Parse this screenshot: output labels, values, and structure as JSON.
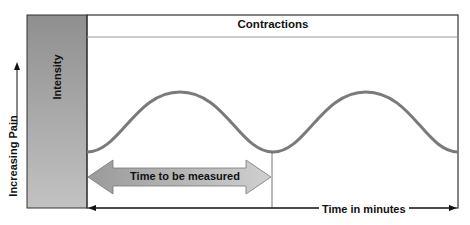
{
  "diagram": {
    "header_title": "Contractions",
    "y_bar_label": "Intensity",
    "y_axis_label": "Increasing Pain",
    "double_arrow_label": "Time to be measured",
    "x_axis_label": "Time in minutes"
  },
  "colors": {
    "frame": "#333333",
    "intensity_bar": "#9a9a9a",
    "wave": "#7a7a7a",
    "arrow_fill": "#b8b8b8",
    "text": "#111111"
  }
}
